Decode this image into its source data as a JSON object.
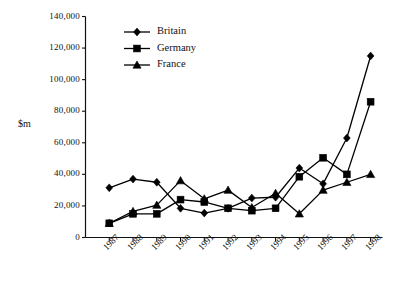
{
  "chart_data": {
    "type": "line",
    "title": "",
    "xlabel": "",
    "ylabel": "$m",
    "categories": [
      "1987",
      "1988",
      "1989",
      "1990",
      "1991",
      "1992",
      "1993",
      "1994",
      "1995",
      "1996",
      "1997",
      "1998"
    ],
    "series": [
      {
        "name": "Britain",
        "marker": "diamond",
        "color": "#000000",
        "values": [
          31500,
          37000,
          35000,
          18500,
          15500,
          18500,
          25000,
          25500,
          44000,
          34000,
          63000,
          115000
        ]
      },
      {
        "name": "Germany",
        "marker": "square",
        "color": "#000000",
        "values": [
          9000,
          15000,
          15000,
          24000,
          22500,
          18500,
          17000,
          18500,
          38500,
          50500,
          40000,
          86000
        ]
      },
      {
        "name": "France",
        "marker": "triangle",
        "color": "#000000",
        "values": [
          9000,
          16500,
          20500,
          36000,
          24500,
          30000,
          19000,
          28000,
          15000,
          30000,
          35000,
          40000
        ]
      }
    ],
    "ylim": [
      0,
      140000
    ],
    "ytick_values": [
      0,
      20000,
      40000,
      60000,
      80000,
      100000,
      120000,
      140000
    ],
    "ytick_labels": [
      "0",
      "20,000",
      "40,000",
      "60,000",
      "80,000",
      "100,000",
      "120,000",
      "140,000"
    ],
    "grid": false,
    "legend_position": "top-left-inside"
  },
  "legend": {
    "entries": [
      {
        "label": "Britain",
        "marker": "diamond-icon"
      },
      {
        "label": "Germany",
        "marker": "square-icon"
      },
      {
        "label": "France",
        "marker": "triangle-icon"
      }
    ]
  }
}
